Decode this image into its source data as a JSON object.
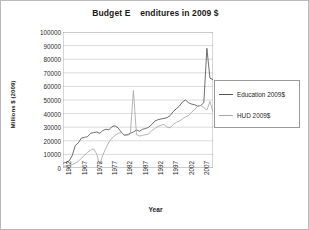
{
  "chart_data": {
    "type": "line",
    "title": "Budget E    enditures in 2009 $",
    "xlabel": "Year",
    "ylabel": "Millions $ (2009)",
    "ylim": [
      0,
      100000
    ],
    "yticks": [
      100000,
      90000,
      80000,
      70000,
      60000,
      50000,
      40000,
      30000,
      20000,
      10000,
      0
    ],
    "ytick_labels": [
      "100000",
      "90000",
      "80000",
      "70000",
      "60000",
      "50000",
      "40000",
      "30000",
      "20000",
      "10000",
      "0"
    ],
    "xlim": [
      1962,
      2011
    ],
    "xticks": [
      1962,
      1967,
      1972,
      1977,
      1982,
      1987,
      1992,
      1997,
      2002,
      2007
    ],
    "xtick_labels": [
      "1962",
      "1967",
      "1972",
      "1977",
      "1982",
      "1987",
      "1992",
      "1997",
      "2002",
      "2007"
    ],
    "grid": "horizontal",
    "legend_position": "right",
    "x": [
      1962,
      1963,
      1964,
      1965,
      1966,
      1967,
      1968,
      1969,
      1970,
      1971,
      1972,
      1973,
      1974,
      1975,
      1976,
      1977,
      1978,
      1979,
      1980,
      1981,
      1982,
      1983,
      1984,
      1985,
      1986,
      1987,
      1988,
      1989,
      1990,
      1991,
      1992,
      1993,
      1994,
      1995,
      1996,
      1997,
      1998,
      1999,
      2000,
      2001,
      2002,
      2003,
      2004,
      2005,
      2006,
      2007,
      2008,
      2009,
      2010,
      2011
    ],
    "series": [
      {
        "name": "Education 2009$",
        "color": "#555555",
        "values": [
          3500,
          4200,
          5200,
          9000,
          16500,
          18500,
          22000,
          22500,
          23000,
          25500,
          26000,
          26500,
          25500,
          27500,
          28500,
          28000,
          30500,
          31000,
          29500,
          26500,
          24000,
          24500,
          25500,
          26500,
          28000,
          27000,
          28500,
          29000,
          30000,
          32000,
          34500,
          35500,
          36000,
          36500,
          37000,
          38500,
          41500,
          43500,
          45500,
          48500,
          50000,
          48000,
          47000,
          46500,
          45500,
          46000,
          48000,
          88000,
          66000,
          65000
        ]
      },
      {
        "name": "HUD 2009$",
        "color": "#a8a8a8",
        "values": [
          1200,
          1500,
          2000,
          2500,
          3500,
          5000,
          7000,
          9500,
          11500,
          13000,
          14000,
          10500,
          2500,
          9500,
          14500,
          19000,
          22000,
          24000,
          25500,
          26000,
          24500,
          24000,
          25000,
          57000,
          24500,
          23500,
          24000,
          24500,
          25000,
          27500,
          29000,
          30500,
          31500,
          32000,
          30000,
          29500,
          32000,
          33500,
          34500,
          36000,
          37500,
          38500,
          41000,
          43000,
          45500,
          46000,
          44500,
          42500,
          49000,
          41000
        ]
      }
    ]
  }
}
